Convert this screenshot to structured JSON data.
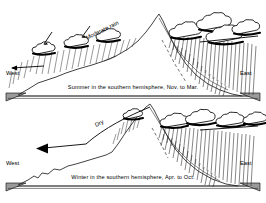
{
  "figure": {
    "background_color": "#ffffff",
    "line_color": "#111111",
    "wedge_color": "#9a9a9a"
  },
  "panels": [
    {
      "id": "summer",
      "caption": "Summer in the southern hemisphere, Nov. to Mar.",
      "west_label": "West",
      "east_label": "East",
      "annotation": "Moderate rain",
      "windward_side": "west",
      "precipitation": {
        "west_slope": "moderate rain",
        "east_slope": "heavy rain"
      }
    },
    {
      "id": "winter",
      "caption": "Winter in the southern hemisphere, Apr. to Oct.",
      "west_label": "West",
      "east_label": "East",
      "annotation": "Dry",
      "windward_side": "east",
      "precipitation": {
        "west_slope": "dry",
        "east_slope": "heavy rain"
      }
    }
  ]
}
